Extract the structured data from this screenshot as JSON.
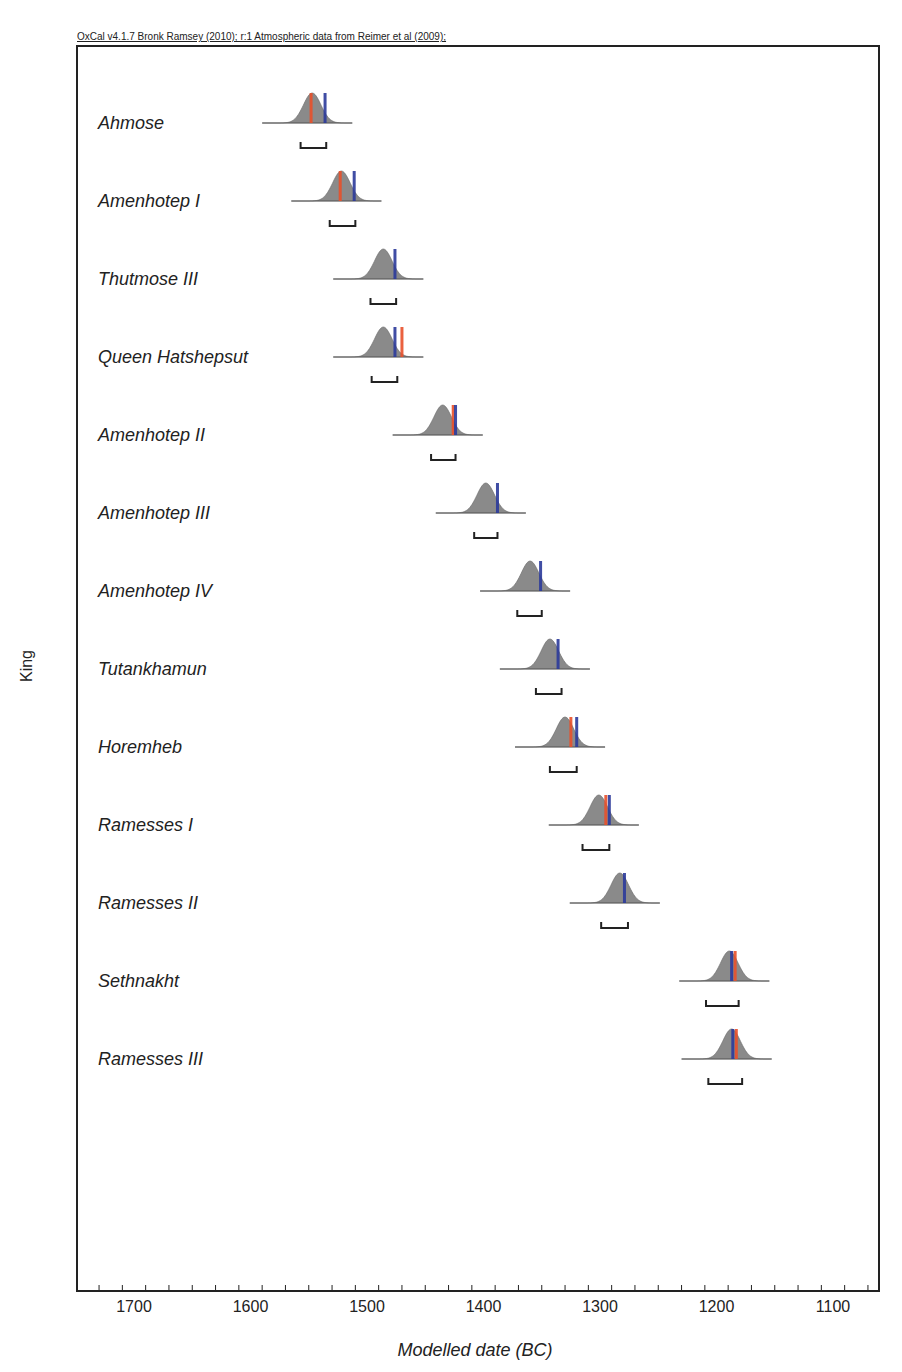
{
  "header": {
    "credit": "OxCal v4.1.7 Bronk Ramsey (2010); r:1 Atmospheric data from Reimer et al (2009);"
  },
  "colors": {
    "distribution": "#8a8a8a",
    "red_marker": "#e8502a",
    "blue_marker": "#2b3a9a",
    "frame": "#222222"
  },
  "chart_data": {
    "type": "scatter",
    "title": "OxCal v4.1.7 Bronk Ramsey (2010); r:1 Atmospheric data from Reimer et al (2009);",
    "xlabel": "Modelled date (BC)",
    "ylabel": "King",
    "xlim": [
      1750,
      1050
    ],
    "x_reversed": true,
    "x_ticks": [
      1700,
      1600,
      1500,
      1400,
      1300,
      1200,
      1100
    ],
    "grid": false,
    "series": [
      {
        "name": "Ahmose",
        "peak": 1547,
        "range_95": [
          1557,
          1535
        ],
        "red": 1548,
        "blue": 1536
      },
      {
        "name": "Amenhotep I",
        "peak": 1522,
        "range_95": [
          1532,
          1510
        ],
        "red": 1523,
        "blue": 1511
      },
      {
        "name": "Thutmose III",
        "peak": 1486,
        "range_95": [
          1497,
          1475
        ],
        "red": null,
        "blue": 1476
      },
      {
        "name": "Queen Hatshepsut",
        "peak": 1486,
        "range_95": [
          1496,
          1474
        ],
        "red": 1470,
        "blue": 1476
      },
      {
        "name": "Amenhotep II",
        "peak": 1435,
        "range_95": [
          1445,
          1424
        ],
        "red": 1426,
        "blue": 1424
      },
      {
        "name": "Amenhotep III",
        "peak": 1398,
        "range_95": [
          1408,
          1388
        ],
        "red": null,
        "blue": 1388
      },
      {
        "name": "Amenhotep IV",
        "peak": 1360,
        "range_95": [
          1371,
          1350
        ],
        "red": null,
        "blue": 1351
      },
      {
        "name": "Tutankhamun",
        "peak": 1343,
        "range_95": [
          1355,
          1333
        ],
        "red": null,
        "blue": 1336
      },
      {
        "name": "Horemheb",
        "peak": 1330,
        "range_95": [
          1343,
          1320
        ],
        "red": 1325,
        "blue": 1320
      },
      {
        "name": "Ramesses I",
        "peak": 1301,
        "range_95": [
          1315,
          1292
        ],
        "red": 1295,
        "blue": 1292
      },
      {
        "name": "Ramesses II",
        "peak": 1283,
        "range_95": [
          1299,
          1276
        ],
        "red": null,
        "blue": 1279
      },
      {
        "name": "Sethnakht",
        "peak": 1189,
        "range_95": [
          1209,
          1181
        ],
        "red": 1184,
        "blue": 1187
      },
      {
        "name": "Ramesses III",
        "peak": 1187,
        "range_95": [
          1207,
          1178
        ],
        "red": 1183,
        "blue": 1186
      }
    ]
  }
}
